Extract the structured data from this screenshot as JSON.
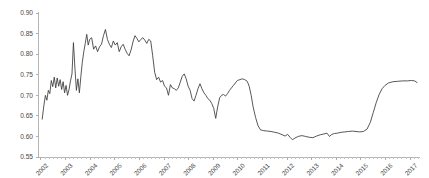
{
  "chart_data": {
    "type": "line",
    "title": "",
    "subtitle": "",
    "xlabel": "",
    "ylabel": "",
    "xlim": [
      2001.9,
      2017.4
    ],
    "ylim": [
      0.55,
      0.9
    ],
    "grid": false,
    "legend": null,
    "line_color": "#3a3a3a",
    "axis_color": "#b5b5b5",
    "tick_label_color": "#4a4a4a",
    "background_color": "#ffffff",
    "y_ticks": [
      0.55,
      0.6,
      0.65,
      0.7,
      0.75,
      0.8,
      0.85,
      0.9
    ],
    "y_tick_labels": [
      "0.55",
      "0.60",
      "0.65",
      "0.70",
      "0.75",
      "0.80",
      "0.85",
      "0.90"
    ],
    "x_ticks": [
      2002,
      2003,
      2004,
      2005,
      2006,
      2007,
      2008,
      2009,
      2010,
      2011,
      2012,
      2013,
      2014,
      2015,
      2016,
      2017
    ],
    "x_tick_labels": [
      "2002",
      "2003",
      "2004",
      "2005",
      "2006",
      "2007",
      "2008",
      "2009",
      "2010",
      "2011",
      "2012",
      "2013",
      "2014",
      "2015",
      "2016",
      "2017"
    ],
    "x_tick_label_rotation": -45,
    "series": [
      {
        "name": "series-1",
        "x": [
          2002.05,
          2002.12,
          2002.18,
          2002.24,
          2002.3,
          2002.36,
          2002.42,
          2002.48,
          2002.54,
          2002.6,
          2002.66,
          2002.72,
          2002.78,
          2002.84,
          2002.9,
          2002.96,
          2003.02,
          2003.08,
          2003.14,
          2003.2,
          2003.26,
          2003.32,
          2003.38,
          2003.44,
          2003.5,
          2003.56,
          2003.62,
          2003.68,
          2003.74,
          2003.8,
          2003.86,
          2003.92,
          2003.98,
          2004.06,
          2004.14,
          2004.22,
          2004.3,
          2004.38,
          2004.46,
          2004.54,
          2004.62,
          2004.7,
          2004.78,
          2004.86,
          2004.94,
          2005.02,
          2005.1,
          2005.18,
          2005.26,
          2005.34,
          2005.42,
          2005.5,
          2005.58,
          2005.66,
          2005.74,
          2005.82,
          2005.9,
          2005.98,
          2006.06,
          2006.14,
          2006.22,
          2006.3,
          2006.38,
          2006.46,
          2006.54,
          2006.62,
          2006.7,
          2006.78,
          2006.86,
          2006.94,
          2007.02,
          2007.1,
          2007.18,
          2007.26,
          2007.34,
          2007.42,
          2007.5,
          2007.58,
          2007.66,
          2007.74,
          2007.82,
          2007.9,
          2007.98,
          2008.06,
          2008.14,
          2008.22,
          2008.3,
          2008.38,
          2008.46,
          2008.54,
          2008.62,
          2008.7,
          2008.78,
          2008.86,
          2008.94,
          2009.02,
          2009.1,
          2009.18,
          2009.26,
          2009.34,
          2009.42,
          2009.5,
          2009.58,
          2009.66,
          2009.74,
          2009.82,
          2009.9,
          2009.98,
          2010.08,
          2010.18,
          2010.28,
          2010.38,
          2010.46,
          2010.54,
          2010.62,
          2010.72,
          2010.82,
          2010.92,
          2011.05,
          2011.2,
          2011.35,
          2011.5,
          2011.65,
          2011.8,
          2011.92,
          2012.02,
          2012.12,
          2012.22,
          2012.32,
          2012.45,
          2012.6,
          2012.75,
          2012.9,
          2013.05,
          2013.2,
          2013.35,
          2013.5,
          2013.62,
          2013.72,
          2013.82,
          2013.92,
          2014.05,
          2014.2,
          2014.35,
          2014.5,
          2014.65,
          2014.8,
          2014.95,
          2015.1,
          2015.25,
          2015.38,
          2015.5,
          2015.62,
          2015.74,
          2015.86,
          2015.98,
          2016.12,
          2016.3,
          2016.5,
          2016.7,
          2016.9,
          2017.05,
          2017.18,
          2017.28
        ],
        "y": [
          0.642,
          0.676,
          0.7,
          0.688,
          0.712,
          0.704,
          0.736,
          0.721,
          0.744,
          0.718,
          0.742,
          0.722,
          0.738,
          0.714,
          0.733,
          0.706,
          0.724,
          0.7,
          0.714,
          0.735,
          0.752,
          0.828,
          0.766,
          0.712,
          0.74,
          0.706,
          0.745,
          0.78,
          0.806,
          0.826,
          0.848,
          0.822,
          0.836,
          0.84,
          0.812,
          0.82,
          0.806,
          0.818,
          0.824,
          0.845,
          0.86,
          0.836,
          0.824,
          0.816,
          0.832,
          0.822,
          0.828,
          0.806,
          0.818,
          0.824,
          0.812,
          0.802,
          0.796,
          0.81,
          0.83,
          0.845,
          0.838,
          0.83,
          0.836,
          0.84,
          0.834,
          0.826,
          0.836,
          0.832,
          0.796,
          0.756,
          0.738,
          0.744,
          0.732,
          0.736,
          0.722,
          0.718,
          0.7,
          0.726,
          0.718,
          0.716,
          0.712,
          0.718,
          0.732,
          0.746,
          0.752,
          0.74,
          0.722,
          0.712,
          0.692,
          0.686,
          0.7,
          0.716,
          0.728,
          0.716,
          0.706,
          0.7,
          0.692,
          0.688,
          0.68,
          0.668,
          0.644,
          0.672,
          0.694,
          0.7,
          0.702,
          0.698,
          0.704,
          0.712,
          0.718,
          0.724,
          0.73,
          0.736,
          0.738,
          0.74,
          0.738,
          0.734,
          0.722,
          0.7,
          0.672,
          0.646,
          0.626,
          0.616,
          0.614,
          0.613,
          0.612,
          0.61,
          0.608,
          0.604,
          0.601,
          0.605,
          0.598,
          0.592,
          0.596,
          0.6,
          0.602,
          0.6,
          0.598,
          0.597,
          0.601,
          0.604,
          0.606,
          0.608,
          0.6,
          0.605,
          0.607,
          0.608,
          0.61,
          0.611,
          0.612,
          0.613,
          0.612,
          0.611,
          0.612,
          0.618,
          0.634,
          0.658,
          0.682,
          0.702,
          0.716,
          0.724,
          0.73,
          0.733,
          0.734,
          0.735,
          0.735,
          0.736,
          0.735,
          0.731
        ]
      }
    ],
    "annotations": {
      "max_value": 0.86,
      "min_value": 0.592,
      "first_value": 0.642,
      "last_value": 0.731
    }
  }
}
